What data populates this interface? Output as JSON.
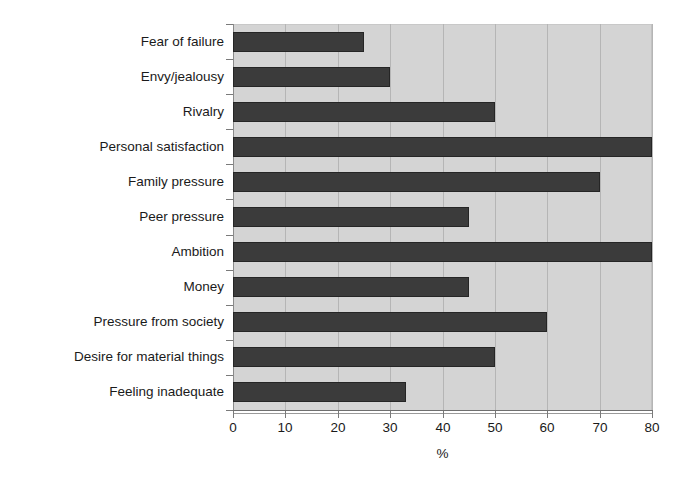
{
  "chart_data": {
    "type": "bar",
    "orientation": "horizontal",
    "title": "",
    "subtitle": "",
    "xlabel": "%",
    "ylabel": "",
    "xlim": [
      0,
      80
    ],
    "xticks": [
      0,
      10,
      20,
      30,
      40,
      50,
      60,
      70,
      80
    ],
    "xticklabels": [
      "0",
      "10",
      "20",
      "30",
      "40",
      "50",
      "60",
      "70",
      "80"
    ],
    "grid": "vertical",
    "legend": "none",
    "categories": [
      "Fear of failure",
      "Envy/jealousy",
      "Rivalry",
      "Personal satisfaction",
      "Family pressure",
      "Peer pressure",
      "Ambition",
      "Money",
      "Pressure from society",
      "Desire for material things",
      "Feeling inadequate"
    ],
    "values": [
      25,
      30,
      50,
      80,
      70,
      45,
      80,
      45,
      60,
      50,
      33
    ],
    "colors": {
      "bar_fill": "#3b3b3b",
      "bar_border": "#252525",
      "plot_background": "#d4d4d4",
      "gridline": "#b5b5b5",
      "axis": "#7a7a7a",
      "page_background": "#ffffff",
      "text": "#1a1a1a"
    }
  }
}
